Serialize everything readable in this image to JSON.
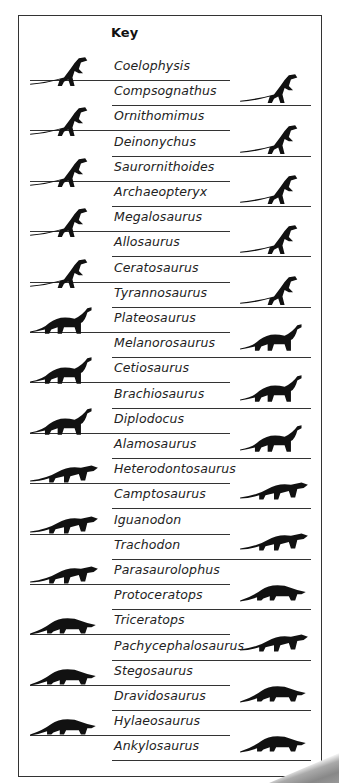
{
  "key": {
    "title": "Key",
    "entries": [
      {
        "name": "Coelophysis",
        "side": "left"
      },
      {
        "name": "Compsognathus",
        "side": "right"
      },
      {
        "name": "Ornithomimus",
        "side": "left"
      },
      {
        "name": "Deinonychus",
        "side": "right"
      },
      {
        "name": "Saurornithoides",
        "side": "left"
      },
      {
        "name": "Archaeopteryx",
        "side": "right"
      },
      {
        "name": "Megalosaurus",
        "side": "left"
      },
      {
        "name": "Allosaurus",
        "side": "right"
      },
      {
        "name": "Ceratosaurus",
        "side": "left"
      },
      {
        "name": "Tyrannosaurus",
        "side": "right"
      },
      {
        "name": "Plateosaurus",
        "side": "left"
      },
      {
        "name": "Melanorosaurus",
        "side": "right"
      },
      {
        "name": "Cetiosaurus",
        "side": "left"
      },
      {
        "name": "Brachiosaurus",
        "side": "right"
      },
      {
        "name": "Diplodocus",
        "side": "left"
      },
      {
        "name": "Alamosaurus",
        "side": "right"
      },
      {
        "name": "Heterodontosaurus",
        "side": "left"
      },
      {
        "name": "Camptosaurus",
        "side": "right"
      },
      {
        "name": "Iguanodon",
        "side": "left"
      },
      {
        "name": "Trachodon",
        "side": "right"
      },
      {
        "name": "Parasaurolophus",
        "side": "left"
      },
      {
        "name": "Protoceratops",
        "side": "right"
      },
      {
        "name": "Triceratops",
        "side": "left"
      },
      {
        "name": "Pachycephalosaurus",
        "side": "right"
      },
      {
        "name": "Stegosaurus",
        "side": "left"
      },
      {
        "name": "Dravidosaurus",
        "side": "right"
      },
      {
        "name": "Hylaeosaurus",
        "side": "left"
      },
      {
        "name": "Ankylosaurus",
        "side": "right"
      }
    ]
  },
  "colors": {
    "silhouette": "#111111",
    "text": "#222222",
    "rule": "#333333",
    "border": "#333333"
  }
}
